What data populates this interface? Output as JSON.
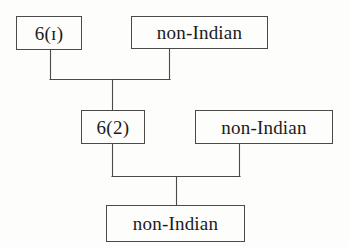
{
  "diagram": {
    "type": "descent-chart",
    "title": "",
    "generations": 3,
    "nodes": [
      {
        "id": "gen1-left",
        "label": "6(ɪ)",
        "kind": "code",
        "generation": 1
      },
      {
        "id": "gen1-right",
        "label": "non-Indian",
        "kind": "name",
        "generation": 1
      },
      {
        "id": "gen2-left",
        "label": "6(2)",
        "kind": "code",
        "generation": 2
      },
      {
        "id": "gen2-right",
        "label": "non-Indian",
        "kind": "name",
        "generation": 2
      },
      {
        "id": "gen3",
        "label": "non-Indian",
        "kind": "name",
        "generation": 3
      }
    ],
    "unions": [
      {
        "id": "union-1",
        "partners": [
          "gen1-left",
          "gen1-right"
        ],
        "child": "gen2-left"
      },
      {
        "id": "union-2",
        "partners": [
          "gen2-left",
          "gen2-right"
        ],
        "child": "gen3"
      }
    ],
    "colors": {
      "line": "#4a4a4a",
      "box_border": "#4a4a4a",
      "text": "#1b1b1b",
      "background": "#fdfdfb"
    }
  }
}
